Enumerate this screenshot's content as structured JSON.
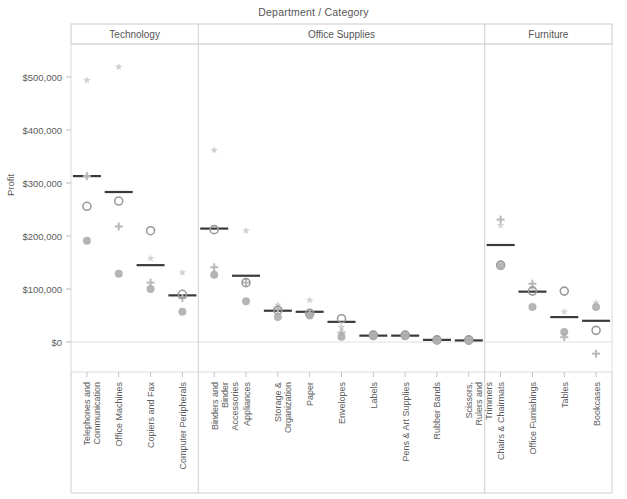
{
  "chart_data": {
    "type": "scatter",
    "title": "Department / Category",
    "xlabel": "",
    "ylabel": "Profit",
    "ylim": [
      -40000,
      540000
    ],
    "yticks": [
      0,
      100000,
      200000,
      300000,
      400000,
      500000
    ],
    "ytick_labels": [
      "$0",
      "$100,000",
      "$200,000",
      "$300,000",
      "$400,000",
      "$500,000"
    ],
    "grid": false,
    "zero_line": true,
    "legend": "none",
    "panels": [
      {
        "name": "Technology",
        "categories": [
          "Telephones and Communication",
          "Office Machines",
          "Copiers and Fax",
          "Computer Peripherals"
        ],
        "reference_values": [
          313000,
          283000,
          145000,
          88000
        ],
        "series": [
          {
            "name": "star",
            "values": [
              494000,
              519000,
              158000,
              131000
            ]
          },
          {
            "name": "plus",
            "values": [
              313000,
              218000,
              112000,
              83000
            ]
          },
          {
            "name": "open-circle",
            "values": [
              256000,
              266000,
              210000,
              90000
            ]
          },
          {
            "name": "filled-circle",
            "values": [
              191000,
              129000,
              100000,
              57000
            ]
          }
        ]
      },
      {
        "name": "Office Supplies",
        "categories": [
          "Binders and Binder Accessories",
          "Appliances",
          "Storage & Organization",
          "Paper",
          "Envelopes",
          "Labels",
          "Pens & Art Supplies",
          "Rubber Bands",
          "Scissors, Rulers and Trimmers"
        ],
        "reference_values": [
          214000,
          125000,
          59000,
          57000,
          38000,
          12000,
          12000,
          4000,
          3000
        ],
        "series": [
          {
            "name": "star",
            "values": [
              362000,
              210000,
              70000,
              79000,
              28000,
              16000,
              15000,
              6000,
              5000
            ]
          },
          {
            "name": "plus",
            "values": [
              141000,
              112000,
              62000,
              52000,
              18000,
              11000,
              12000,
              3000,
              2000
            ]
          },
          {
            "name": "open-circle",
            "values": [
              212000,
              112000,
              60000,
              54000,
              44000,
              13000,
              13000,
              4000,
              4000
            ]
          },
          {
            "name": "filled-circle",
            "values": [
              127000,
              77000,
              47000,
              50000,
              10000,
              11000,
              11000,
              3000,
              2000
            ]
          }
        ]
      },
      {
        "name": "Furniture",
        "categories": [
          "Chairs & Chairmats",
          "Office Furnishings",
          "Tables",
          "Bookcases"
        ],
        "reference_values": [
          183000,
          95000,
          47000,
          40000
        ],
        "series": [
          {
            "name": "star",
            "values": [
              220000,
              103000,
              57000,
              74000
            ]
          },
          {
            "name": "plus",
            "values": [
              231000,
              110000,
              9000,
              -22000
            ]
          },
          {
            "name": "open-circle",
            "values": [
              145000,
              96000,
              96000,
              22000
            ]
          },
          {
            "name": "filled-circle",
            "values": [
              143000,
              66000,
              19000,
              66000
            ]
          }
        ]
      }
    ],
    "marker_colors": {
      "star": "#d0d0d0",
      "plus": "#b8b8b8",
      "open-circle": "#9a9a9a",
      "filled-circle": "#adadad",
      "reference_line": "#3a3a3a"
    }
  }
}
